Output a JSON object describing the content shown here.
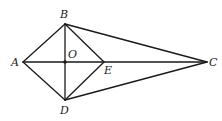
{
  "diagram": {
    "type": "geometry-figure",
    "points": {
      "A": {
        "label": "A",
        "x": 23,
        "y": 62,
        "lx": 11,
        "ly": 66
      },
      "B": {
        "label": "B",
        "x": 65,
        "y": 24,
        "lx": 60,
        "ly": 18
      },
      "C": {
        "label": "C",
        "x": 207,
        "y": 62,
        "lx": 209,
        "ly": 66
      },
      "D": {
        "label": "D",
        "x": 65,
        "y": 100,
        "lx": 60,
        "ly": 114
      },
      "E": {
        "label": "E",
        "x": 104,
        "y": 62,
        "lx": 104,
        "ly": 74
      },
      "O": {
        "label": "O",
        "x": 65,
        "y": 62,
        "lx": 68,
        "ly": 58
      }
    },
    "segments": [
      [
        "A",
        "B"
      ],
      [
        "A",
        "D"
      ],
      [
        "B",
        "E"
      ],
      [
        "D",
        "E"
      ],
      [
        "B",
        "D"
      ],
      [
        "A",
        "C"
      ],
      [
        "B",
        "C"
      ],
      [
        "D",
        "C"
      ]
    ],
    "marked_points": [
      "O"
    ],
    "colors": {
      "stroke": "#1a1a1a",
      "label": "#222222",
      "background": "#ffffff"
    }
  }
}
